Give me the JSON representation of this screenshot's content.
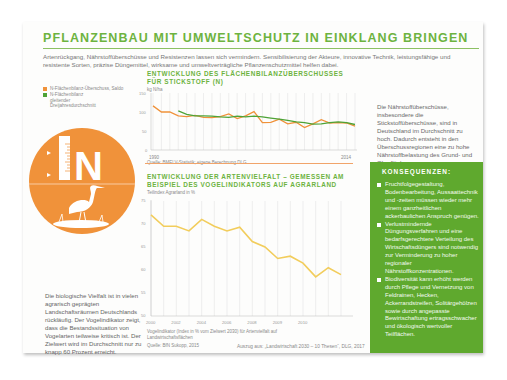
{
  "header": {
    "title": "PFLANZENBAU MIT UMWELTSCHUTZ IN EINKLANG BRINGEN",
    "intro": "Artenrückgang, Nährstoffüberschüsse und Resistenzen lassen sich vermindern. Sensibilisierung der Akteure, innovative Technik, leistungsfähige und resistente Sorten, präzise Düngemittel, wirksame und umweltverträgliche Pflanzenschutzmittel helfen dabei."
  },
  "legend": {
    "items": [
      {
        "label": "N-Flächenbilanz-Überschuss, Saldo",
        "color": "#f0923a"
      },
      {
        "label": "N-Flächenbilanz gleitender Dreijahresdurchschnitt",
        "color": "#4ea337"
      }
    ]
  },
  "emblem": {
    "letter": "N",
    "color": "#f0923a",
    "icons": [
      "ruler-icon",
      "stork-icon"
    ]
  },
  "left_text": "Die biologische Vielfalt ist in vielen agrarisch geprägten Landschaftsräumen Deutschlands rückläufig. Der Vogelindikator zeigt, dass die Bestandssituation von Vogelarten teilweise kritisch ist. Der Zielwert wird im Durchschnitt nur zu knapp 60 Prozent erreicht.",
  "right_text": "Die Nährstoffüberschüsse, insbesondere die Stickstoffüberschüsse, sind in Deutschland im Durchschnitt zu hoch. Dadurch entsteht in den Überschussregionen eine zu hohe Nährstoffbelastung des Grund- und Oberflächenwassers.",
  "consequences": {
    "heading": "KONSEQUENZEN:",
    "items": [
      "Fruchtfolgegestaltung, Bodenbearbeitung, Aussaattechnik und -zeiten müssen wieder mehr einem ganzheitlichen ackerbaulichen Anspruch genügen.",
      "Verlustmindernde Düngungsverfahren und eine bedarfsgerechtere Verteilung des Wirtschaftsdüngers sind notwendig zur Verminderung zu hoher regionaler Nährstoffkonzentrationen.",
      "Biodiversität kann erhöht werden durch Pflege und Vernetzung von Feldrainen, Hecken, Ackerrandstreifen, Solitärgehölzen sowie durch angepasste Bewirtschaftung ertragsschwacher und ökologisch wertvoller Teilflächen."
    ]
  },
  "footer": {
    "credit": "Auszug aus: „Landwirtschaft 2030 – 10 Thesen“, DLG, 2017"
  },
  "chart_data": [
    {
      "type": "line",
      "title": "ENTWICKLUNG DES FLÄCHENBILANZÜBERSCHUSSES FÜR STICKSTOFF (N)",
      "ylabel": "kg N/ha",
      "xlabel": "",
      "ylim": [
        0,
        150
      ],
      "yticks": [
        0,
        50,
        100,
        150
      ],
      "xtick_labels": [
        "1990",
        "2014"
      ],
      "grid": "vertical",
      "source": "Quelle: BMELV-Statistik; eigene Berechnung DLG",
      "x": [
        1990,
        1991,
        1992,
        1993,
        1994,
        1995,
        1996,
        1997,
        1998,
        1999,
        2000,
        2001,
        2002,
        2003,
        2004,
        2005,
        2006,
        2007,
        2008,
        2009,
        2010,
        2011,
        2012,
        2013,
        2014
      ],
      "series": [
        {
          "name": "N-Flächenbilanz-Überschuss, Saldo",
          "color": "#f0923a",
          "values": [
            116,
            100,
            100,
            90,
            88,
            91,
            86,
            85,
            88,
            95,
            83,
            90,
            101,
            72,
            73,
            81,
            69,
            73,
            59,
            69,
            80,
            71,
            72,
            71,
            63
          ]
        },
        {
          "name": "N-Flächenbilanz gleitender Dreijahresdurchschnitt",
          "color": "#4ea337",
          "values": [
            null,
            null,
            null,
            103,
            94,
            90,
            90,
            89,
            87,
            86,
            89,
            87,
            89,
            87,
            84,
            81,
            78,
            74,
            72,
            68,
            69,
            72,
            74,
            72,
            67
          ]
        }
      ]
    },
    {
      "type": "line",
      "title": "ENTWICKLUNG DER ARTENVIELFALT – GEMESSEN AM BEISPIEL DES VOGELINDIKATORS AUF AGRARLAND",
      "ylabel": "Teilindex Agrarland in %",
      "xlabel": "",
      "ylim": [
        50,
        75
      ],
      "yticks": [
        50,
        55,
        60,
        65,
        70,
        75
      ],
      "xtick_labels": [
        "2000",
        "2002",
        "2004",
        "2006",
        "2008",
        "2009",
        "2010"
      ],
      "grid": "vertical",
      "note": "Vogelindikator (Index in % vom Zielwert 2030) für Artenvielfalt auf Landwirtschaftsflächen",
      "source": "Quelle: BfN Sukopp, 2015",
      "x": [
        2000,
        2001,
        2002,
        2003,
        2004,
        2005,
        2006,
        2007,
        2008,
        2009,
        2010,
        2011
      ],
      "series": [
        {
          "name": "Teilindex Agrarland",
          "color": "#f2cd5c",
          "values": [
            72,
            69,
            69,
            68,
            71,
            69,
            68,
            69,
            66,
            65,
            63,
            63
          ]
        }
      ],
      "full_series_values": [
        72,
        69.5,
        69.5,
        68.5,
        71,
        69.5,
        68.5,
        69.3,
        66.2,
        65,
        62.5,
        63,
        61.5,
        58.5,
        60.5,
        59
      ]
    }
  ]
}
